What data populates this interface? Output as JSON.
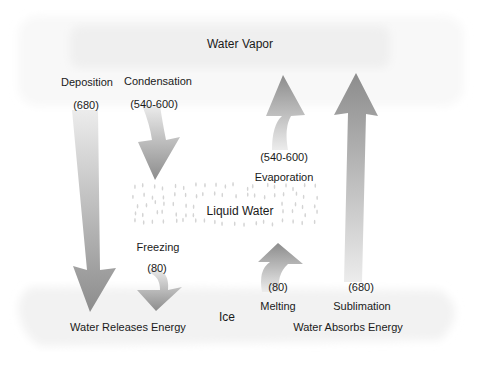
{
  "states": {
    "vapor": "Water Vapor",
    "liquid": "Liquid Water",
    "ice": "Ice"
  },
  "energy": {
    "releases": "Water Releases Energy",
    "absorbs": "Water Absorbs Energy"
  },
  "processes": [
    {
      "name": "Deposition",
      "value": "(680)",
      "direction": "down",
      "from": "Water Vapor",
      "to": "Ice"
    },
    {
      "name": "Condensation",
      "value": "(540-600)",
      "direction": "down",
      "from": "Water Vapor",
      "to": "Liquid Water"
    },
    {
      "name": "Freezing",
      "value": "(80)",
      "direction": "down",
      "from": "Liquid Water",
      "to": "Ice"
    },
    {
      "name": "Evaporation",
      "value": "(540-600)",
      "direction": "up",
      "from": "Liquid Water",
      "to": "Water Vapor"
    },
    {
      "name": "Melting",
      "value": "(80)",
      "direction": "up",
      "from": "Ice",
      "to": "Liquid Water"
    },
    {
      "name": "Sublimation",
      "value": "(680)",
      "direction": "up",
      "from": "Ice",
      "to": "Water Vapor"
    }
  ],
  "colors": {
    "arrow_dark": "#8e8e8e",
    "arrow_light": "#e6e6e6",
    "band": "#f2f2f2"
  }
}
